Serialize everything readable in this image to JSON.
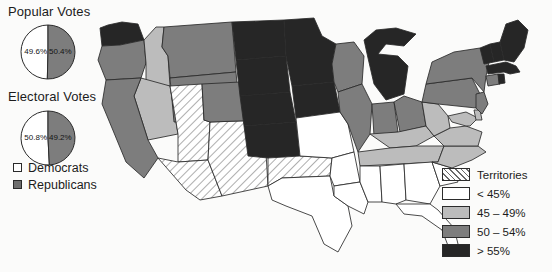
{
  "charts": {
    "popular": {
      "title": "Popular Votes",
      "democrat_pct": "49.6%",
      "republican_pct": "50.4%",
      "democrat_value": 49.6,
      "republican_value": 50.4
    },
    "electoral": {
      "title": "Electoral Votes",
      "democrat_pct": "50.8%",
      "republican_pct": "49.2%",
      "democrat_value": 50.8,
      "republican_value": 49.2
    }
  },
  "party_key": {
    "items": [
      {
        "label": "Democrats",
        "color": "#ffffff"
      },
      {
        "label": "Republicans",
        "color": "#6e6e6e"
      }
    ]
  },
  "legend": {
    "items": [
      {
        "label": "Territories",
        "pattern": "hatch",
        "color": "#ffffff"
      },
      {
        "label": "< 45%",
        "pattern": "solid",
        "color": "#ffffff"
      },
      {
        "label": "45 – 49%",
        "pattern": "solid",
        "color": "#bcbcbc"
      },
      {
        "label": "50 – 54%",
        "pattern": "solid",
        "color": "#7d7d7d"
      },
      {
        "label": "> 55%",
        "pattern": "solid",
        "color": "#262626"
      }
    ]
  },
  "chart_data": {
    "type": "map",
    "title": "",
    "subtitle": "",
    "legend_position": "bottom-right",
    "color_scale": {
      "Territories": "#ffffff-hatched",
      "< 45%": "#ffffff",
      "45 - 49%": "#bcbcbc",
      "50 - 54%": "#7d7d7d",
      "> 55%": "#262626"
    },
    "pies": [
      {
        "name": "Popular Votes",
        "type": "pie",
        "slices": [
          {
            "label": "Democrats",
            "value": 49.6,
            "display": "49.6%",
            "color": "#ffffff"
          },
          {
            "label": "Republicans",
            "value": 50.4,
            "display": "50.4%",
            "color": "#7d7d7d"
          }
        ]
      },
      {
        "name": "Electoral Votes",
        "type": "pie",
        "slices": [
          {
            "label": "Democrats",
            "value": 50.8,
            "display": "50.8%",
            "color": "#ffffff"
          },
          {
            "label": "Republicans",
            "value": 49.2,
            "display": "49.2%",
            "color": "#7d7d7d"
          }
        ]
      }
    ],
    "states": [
      {
        "name": "Washington",
        "class": "f-dark",
        "bucket": "> 55%"
      },
      {
        "name": "Oregon",
        "class": "f-mid",
        "bucket": "50 - 54%"
      },
      {
        "name": "California",
        "class": "f-mid",
        "bucket": "50 - 54%"
      },
      {
        "name": "Idaho",
        "class": "f-light",
        "bucket": "45 - 49%"
      },
      {
        "name": "Nevada",
        "class": "f-light",
        "bucket": "45 - 49%"
      },
      {
        "name": "Montana",
        "class": "f-mid",
        "bucket": "50 - 54%"
      },
      {
        "name": "Wyoming",
        "class": "f-mid",
        "bucket": "50 - 54%"
      },
      {
        "name": "Utah",
        "class": "f-terr",
        "bucket": "Territories"
      },
      {
        "name": "Arizona",
        "class": "f-terr",
        "bucket": "Territories"
      },
      {
        "name": "New Mexico",
        "class": "f-terr",
        "bucket": "Territories"
      },
      {
        "name": "Colorado",
        "class": "f-mid",
        "bucket": "50 - 54%"
      },
      {
        "name": "North Dakota",
        "class": "f-dark",
        "bucket": "> 55%"
      },
      {
        "name": "South Dakota",
        "class": "f-dark",
        "bucket": "> 55%"
      },
      {
        "name": "Nebraska",
        "class": "f-dark",
        "bucket": "> 55%"
      },
      {
        "name": "Kansas",
        "class": "f-dark",
        "bucket": "> 55%"
      },
      {
        "name": "Oklahoma",
        "class": "f-terr",
        "bucket": "Territories"
      },
      {
        "name": "Texas",
        "class": "f-white",
        "bucket": "< 45%"
      },
      {
        "name": "Minnesota",
        "class": "f-dark",
        "bucket": "> 55%"
      },
      {
        "name": "Iowa",
        "class": "f-dark",
        "bucket": "> 55%"
      },
      {
        "name": "Missouri",
        "class": "f-white",
        "bucket": "< 45%"
      },
      {
        "name": "Arkansas",
        "class": "f-white",
        "bucket": "< 45%"
      },
      {
        "name": "Louisiana",
        "class": "f-white",
        "bucket": "< 45%"
      },
      {
        "name": "Wisconsin",
        "class": "f-mid",
        "bucket": "50 - 54%"
      },
      {
        "name": "Illinois",
        "class": "f-mid",
        "bucket": "50 - 54%"
      },
      {
        "name": "Michigan",
        "class": "f-dark",
        "bucket": "> 55%"
      },
      {
        "name": "Indiana",
        "class": "f-mid",
        "bucket": "50 - 54%"
      },
      {
        "name": "Ohio",
        "class": "f-mid",
        "bucket": "50 - 54%"
      },
      {
        "name": "Kentucky",
        "class": "f-light",
        "bucket": "45 - 49%"
      },
      {
        "name": "Tennessee",
        "class": "f-light",
        "bucket": "45 - 49%"
      },
      {
        "name": "Mississippi",
        "class": "f-white",
        "bucket": "< 45%"
      },
      {
        "name": "Alabama",
        "class": "f-white",
        "bucket": "< 45%"
      },
      {
        "name": "Georgia",
        "class": "f-white",
        "bucket": "< 45%"
      },
      {
        "name": "Florida",
        "class": "f-white",
        "bucket": "< 45%"
      },
      {
        "name": "South Carolina",
        "class": "f-white",
        "bucket": "< 45%"
      },
      {
        "name": "North Carolina",
        "class": "f-light",
        "bucket": "45 - 49%"
      },
      {
        "name": "Virginia",
        "class": "f-light",
        "bucket": "45 - 49%"
      },
      {
        "name": "West Virginia",
        "class": "f-light",
        "bucket": "45 - 49%"
      },
      {
        "name": "Maryland",
        "class": "f-light",
        "bucket": "45 - 49%"
      },
      {
        "name": "Delaware",
        "class": "f-light",
        "bucket": "45 - 49%"
      },
      {
        "name": "Pennsylvania",
        "class": "f-mid",
        "bucket": "50 - 54%"
      },
      {
        "name": "New Jersey",
        "class": "f-mid",
        "bucket": "50 - 54%"
      },
      {
        "name": "New York",
        "class": "f-mid",
        "bucket": "50 - 54%"
      },
      {
        "name": "Connecticut",
        "class": "f-mid",
        "bucket": "50 - 54%"
      },
      {
        "name": "Rhode Island",
        "class": "f-dark",
        "bucket": "> 55%"
      },
      {
        "name": "Massachusetts",
        "class": "f-dark",
        "bucket": "> 55%"
      },
      {
        "name": "Vermont",
        "class": "f-dark",
        "bucket": "> 55%"
      },
      {
        "name": "New Hampshire",
        "class": "f-dark",
        "bucket": "> 55%"
      },
      {
        "name": "Maine",
        "class": "f-dark",
        "bucket": "> 55%"
      }
    ]
  }
}
